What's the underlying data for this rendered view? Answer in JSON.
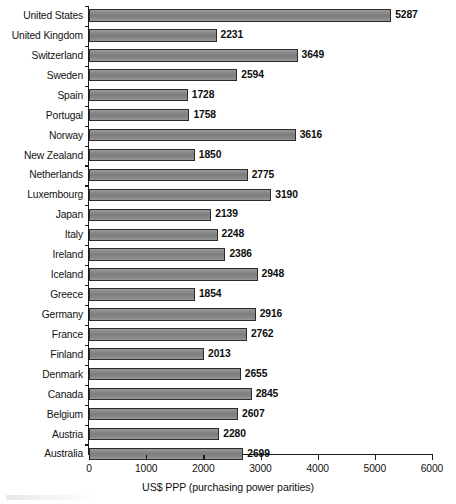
{
  "chart_data": {
    "type": "bar",
    "orientation": "horizontal",
    "title": "",
    "xlabel": "US$ PPP (purchasing power parities)",
    "ylabel": "",
    "xlim": [
      0,
      6000
    ],
    "xticks": [
      0,
      1000,
      2000,
      3000,
      4000,
      5000,
      6000
    ],
    "xtick_labels": [
      "0",
      "1000",
      "2000",
      "3000",
      "4000",
      "5000",
      "6000"
    ],
    "grid": false,
    "legend": null,
    "bar_color": "#828282",
    "bar_edge_color": "#2b2b2b",
    "categories": [
      "United States",
      "United Kingdom",
      "Switzerland",
      "Sweden",
      "Spain",
      "Portugal",
      "Norway",
      "New Zealand",
      "Netherlands",
      "Luxembourg",
      "Japan",
      "Italy",
      "Ireland",
      "Iceland",
      "Greece",
      "Germany",
      "France",
      "Finland",
      "Denmark",
      "Canada",
      "Belgium",
      "Austria",
      "Australia"
    ],
    "values": [
      5287,
      2231,
      3649,
      2594,
      1728,
      1758,
      3616,
      1850,
      2775,
      3190,
      2139,
      2248,
      2386,
      2948,
      1854,
      2916,
      2762,
      2013,
      2655,
      2845,
      2607,
      2280,
      2699
    ],
    "value_labels": [
      "5287",
      "2231",
      "3649",
      "2594",
      "1728",
      "1758",
      "3616",
      "1850",
      "2775",
      "3190",
      "2139",
      "2248",
      "2386",
      "2948",
      "1854",
      "2916",
      "2762",
      "2013",
      "2655",
      "2845",
      "2607",
      "2280",
      "2699"
    ]
  }
}
